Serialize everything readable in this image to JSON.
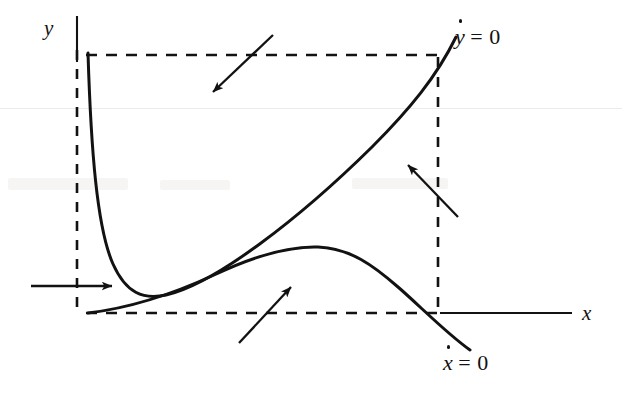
{
  "figure": {
    "background_color": "#ffffff",
    "ink_color": "#121212"
  },
  "axes": {
    "x_label": "x",
    "y_label": "y",
    "x_axis": {
      "x1": 440,
      "y1": 313,
      "x2": 572,
      "y2": 313
    },
    "y_axis": {
      "x1": 77,
      "y1": 16,
      "x2": 77,
      "y2": 62
    }
  },
  "curves": [
    {
      "name": "ydot-nullcline",
      "label": "ẏ = 0",
      "label_var": "y",
      "label_eq": "= 0",
      "description": "steeply falling then rising U-shaped curve"
    },
    {
      "name": "xdot-nullcline",
      "label": "ẋ = 0",
      "label_var": "x",
      "label_eq": "= 0",
      "description": "gently rising curve with a maximum then falling below axis"
    }
  ],
  "dashed_lines": [
    {
      "name": "top-dashed-horizontal",
      "x1": 88,
      "y1": 55,
      "x2": 438,
      "y2": 55
    },
    {
      "name": "left-dashed-vertical",
      "x1": 77,
      "y1": 52,
      "x2": 77,
      "y2": 313
    },
    {
      "name": "bottom-dashed-horizontal",
      "x1": 88,
      "y1": 313,
      "x2": 440,
      "y2": 313
    },
    {
      "name": "right-dashed-vertical",
      "x1": 438,
      "y1": 55,
      "x2": 438,
      "y2": 313
    }
  ],
  "direction_arrows": [
    {
      "name": "arrow-top-region",
      "direction": "down-left",
      "x1": 273,
      "y1": 35,
      "x2": 211,
      "y2": 94
    },
    {
      "name": "arrow-right-region",
      "direction": "up-left",
      "x1": 458,
      "y1": 217,
      "x2": 406,
      "y2": 163
    },
    {
      "name": "arrow-left-region",
      "direction": "right",
      "x1": 31,
      "y1": 286,
      "x2": 114,
      "y2": 286
    },
    {
      "name": "arrow-bottom-region",
      "direction": "up-right",
      "x1": 239,
      "y1": 343,
      "x2": 293,
      "y2": 285
    }
  ]
}
